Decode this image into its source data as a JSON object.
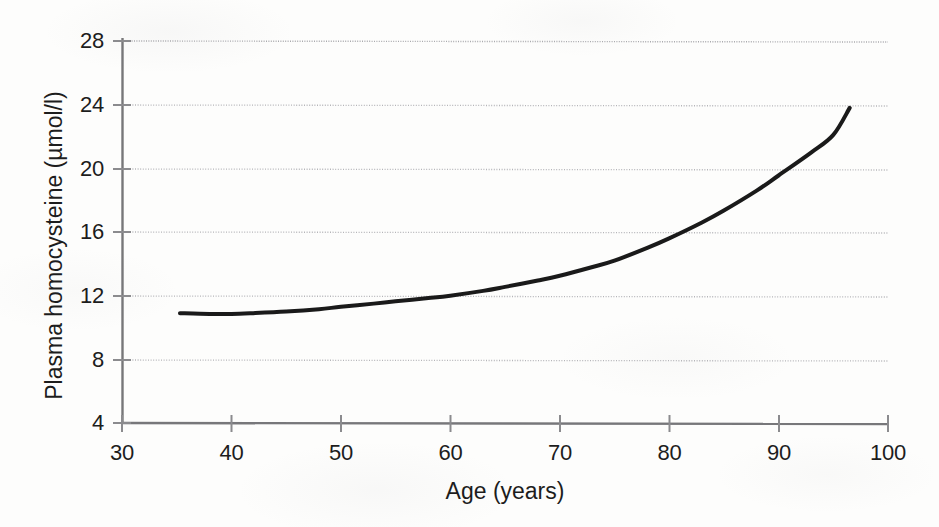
{
  "chart_data": {
    "type": "line",
    "title": "",
    "subtitle": "",
    "xlabel": "Age (years)",
    "ylabel": "Plasma homocysteine  (µmol/l)",
    "xlim": [
      30,
      100
    ],
    "ylim": [
      4,
      28
    ],
    "xticks": [
      30,
      40,
      50,
      60,
      70,
      80,
      90,
      100
    ],
    "yticks": [
      4,
      8,
      12,
      16,
      20,
      24,
      28
    ],
    "xtick_labels": [
      "30",
      "40",
      "50",
      "60",
      "70",
      "80",
      "90",
      "100"
    ],
    "ytick_labels": [
      "4",
      "8",
      "12",
      "16",
      "20",
      "24",
      "28"
    ],
    "grid": "horizontal-dotted",
    "legend": "none",
    "annotations": [],
    "series": [
      {
        "name": "Plasma homocysteine vs age",
        "color": "#1a1a1a",
        "line_width": 4,
        "x": [
          35.3,
          38,
          40,
          42,
          45,
          48,
          50,
          53,
          55,
          58,
          60,
          63,
          65,
          68,
          70,
          73,
          75,
          78,
          80,
          83,
          85,
          88,
          90,
          93,
          95,
          96.5
        ],
        "y": [
          10.9,
          10.85,
          10.85,
          10.9,
          11.0,
          11.15,
          11.3,
          11.5,
          11.65,
          11.85,
          12.0,
          12.3,
          12.55,
          12.95,
          13.25,
          13.8,
          14.2,
          15.0,
          15.6,
          16.6,
          17.35,
          18.6,
          19.55,
          21.0,
          22.1,
          23.8
        ]
      }
    ]
  },
  "axes": {
    "x_title": "Age (years)",
    "y_title": "Plasma homocysteine  (µmol/l)"
  }
}
